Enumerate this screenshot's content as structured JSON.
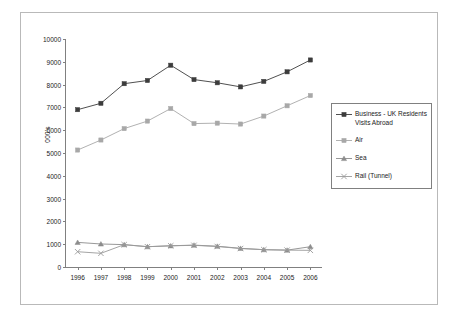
{
  "chart_data": {
    "type": "line",
    "title": "",
    "xlabel": "",
    "ylabel": "000's",
    "categories": [
      "1996",
      "1997",
      "1998",
      "1999",
      "2000",
      "2001",
      "2002",
      "2003",
      "2004",
      "2005",
      "2006"
    ],
    "ylim": [
      0,
      10000
    ],
    "y_ticks": [
      0,
      1000,
      2000,
      3000,
      4000,
      5000,
      6000,
      7000,
      8000,
      9000,
      10000
    ],
    "y_tick_labels": [
      "0",
      "1000",
      "2000",
      "3000",
      "4000",
      "5000",
      "6000",
      "7000",
      "8000",
      "9000",
      "10000"
    ],
    "grid": false,
    "legend_position": "right",
    "series": [
      {
        "name": "Business - UK Residents Visits Abroad",
        "color": "#3c3c3c",
        "marker": "square",
        "values": [
          6900,
          7180,
          8040,
          8180,
          8850,
          8220,
          8080,
          7900,
          8140,
          8560,
          9080
        ]
      },
      {
        "name": "Air",
        "color": "#a8a8a8",
        "marker": "square",
        "values": [
          5130,
          5570,
          6070,
          6400,
          6950,
          6290,
          6310,
          6270,
          6620,
          7070,
          7520
        ]
      },
      {
        "name": "Sea",
        "color": "#8c8c8c",
        "marker": "triangle",
        "values": [
          1080,
          1010,
          980,
          890,
          930,
          960,
          910,
          820,
          760,
          740,
          890
        ]
      },
      {
        "name": "Rail (Tunnel)",
        "color": "#9a9a9a",
        "marker": "cross",
        "values": [
          670,
          600,
          980,
          890,
          930,
          950,
          900,
          810,
          760,
          740,
          730
        ]
      }
    ]
  },
  "legend": {
    "items": [
      {
        "label": "Business - UK Residents Visits Abroad",
        "marker": "square",
        "color": "#3c3c3c"
      },
      {
        "label": "Air",
        "marker": "square",
        "color": "#a8a8a8"
      },
      {
        "label": "Sea",
        "marker": "triangle",
        "color": "#8c8c8c"
      },
      {
        "label": "Rail (Tunnel)",
        "marker": "cross",
        "color": "#9a9a9a"
      }
    ]
  },
  "axes": {
    "y_title": "000's"
  }
}
